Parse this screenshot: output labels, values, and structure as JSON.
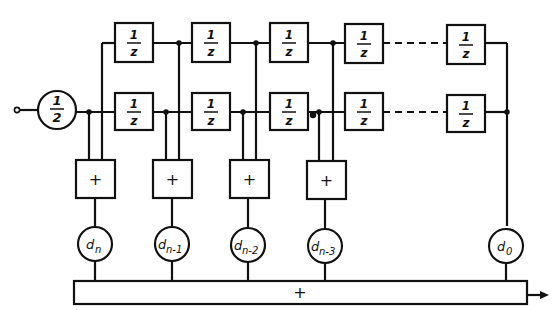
{
  "diagram": {
    "type": "block-diagram",
    "input": {
      "scale_label_num": "1",
      "scale_label_den": "2"
    },
    "delay_element": {
      "num": "1",
      "den": "z"
    },
    "top_chain": {
      "count_visible": 5,
      "labels": [
        "1/z",
        "1/z",
        "1/z",
        "1/z",
        "1/z"
      ]
    },
    "bottom_chain": {
      "count_visible": 5,
      "labels": [
        "1/z",
        "1/z",
        "1/z",
        "1/z",
        "1/z"
      ]
    },
    "adders": [
      {
        "label": "+"
      },
      {
        "label": "+"
      },
      {
        "label": "+"
      },
      {
        "label": "+"
      }
    ],
    "coefficients": [
      {
        "base": "d",
        "sub": "n"
      },
      {
        "base": "d",
        "sub": "n-1"
      },
      {
        "base": "d",
        "sub": "n-2"
      },
      {
        "base": "d",
        "sub": "n-3"
      },
      {
        "base": "d",
        "sub": "0"
      }
    ],
    "sum_bar": {
      "label": "+"
    },
    "output": {
      "arrow": "right-arrow"
    }
  }
}
